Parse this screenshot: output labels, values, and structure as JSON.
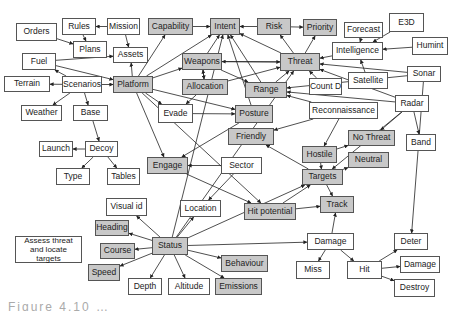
{
  "diagram": {
    "type": "concept-map",
    "colors": {
      "grey_node": "#c8c8c8",
      "white_node": "#ffffff",
      "border": "#555555",
      "edge": "#222222"
    },
    "nodes": [
      {
        "id": "orders",
        "label": "Orders",
        "x": 16,
        "y": 23,
        "w": 41,
        "h": 18,
        "style": "white"
      },
      {
        "id": "rules",
        "label": "Rules",
        "x": 62,
        "y": 18,
        "w": 34,
        "h": 17,
        "style": "white"
      },
      {
        "id": "mission",
        "label": "Mission",
        "x": 107,
        "y": 18,
        "w": 33,
        "h": 17,
        "style": "white"
      },
      {
        "id": "plans",
        "label": "Plans",
        "x": 73,
        "y": 41,
        "w": 34,
        "h": 17,
        "style": "white"
      },
      {
        "id": "assets",
        "label": "Assets",
        "x": 113,
        "y": 47,
        "w": 35,
        "h": 16,
        "style": "white"
      },
      {
        "id": "fuel",
        "label": "Fuel",
        "x": 22,
        "y": 53,
        "w": 34,
        "h": 17,
        "style": "white"
      },
      {
        "id": "terrain",
        "label": "Terrain",
        "x": 4,
        "y": 76,
        "w": 46,
        "h": 16,
        "style": "white"
      },
      {
        "id": "scenarios",
        "label": "Scenarios",
        "x": 62,
        "y": 76,
        "w": 40,
        "h": 17,
        "style": "white"
      },
      {
        "id": "platform",
        "label": "Platform",
        "x": 113,
        "y": 76,
        "w": 40,
        "h": 17,
        "style": "grey"
      },
      {
        "id": "capability",
        "label": "Capability",
        "x": 148,
        "y": 18,
        "w": 45,
        "h": 17,
        "style": "grey"
      },
      {
        "id": "intent",
        "label": "Intent",
        "x": 210,
        "y": 18,
        "w": 30,
        "h": 17,
        "style": "grey"
      },
      {
        "id": "risk",
        "label": "Risk",
        "x": 257,
        "y": 18,
        "w": 34,
        "h": 17,
        "style": "grey"
      },
      {
        "id": "priority",
        "label": "Priority",
        "x": 303,
        "y": 19,
        "w": 34,
        "h": 17,
        "style": "grey"
      },
      {
        "id": "forecast",
        "label": "Forecast",
        "x": 344,
        "y": 22,
        "w": 39,
        "h": 16,
        "style": "white"
      },
      {
        "id": "e3d",
        "label": "E3D",
        "x": 389,
        "y": 13,
        "w": 35,
        "h": 19,
        "style": "white"
      },
      {
        "id": "intelligence",
        "label": "Intelligence",
        "x": 332,
        "y": 42,
        "w": 51,
        "h": 18,
        "style": "white"
      },
      {
        "id": "humint",
        "label": "Humint",
        "x": 412,
        "y": 37,
        "w": 36,
        "h": 18,
        "style": "white"
      },
      {
        "id": "weapons",
        "label": "Weapons",
        "x": 182,
        "y": 53,
        "w": 40,
        "h": 17,
        "style": "grey"
      },
      {
        "id": "threat",
        "label": "Threat",
        "x": 280,
        "y": 53,
        "w": 40,
        "h": 18,
        "style": "grey"
      },
      {
        "id": "satellite",
        "label": "Satellite",
        "x": 348,
        "y": 72,
        "w": 40,
        "h": 17,
        "style": "white"
      },
      {
        "id": "sonar",
        "label": "Sonar",
        "x": 407,
        "y": 66,
        "w": 34,
        "h": 16,
        "style": "white"
      },
      {
        "id": "allocation",
        "label": "Allocation",
        "x": 182,
        "y": 79,
        "w": 46,
        "h": 16,
        "style": "grey"
      },
      {
        "id": "range",
        "label": "Range",
        "x": 245,
        "y": 82,
        "w": 42,
        "h": 16,
        "style": "grey"
      },
      {
        "id": "countd",
        "label": "Count D",
        "x": 309,
        "y": 78,
        "w": 33,
        "h": 17,
        "style": "white"
      },
      {
        "id": "radar",
        "label": "Radar",
        "x": 395,
        "y": 95,
        "w": 34,
        "h": 17,
        "style": "white"
      },
      {
        "id": "weather",
        "label": "Weather",
        "x": 21,
        "y": 105,
        "w": 41,
        "h": 16,
        "style": "white"
      },
      {
        "id": "base",
        "label": "Base",
        "x": 73,
        "y": 105,
        "w": 35,
        "h": 16,
        "style": "white"
      },
      {
        "id": "evade",
        "label": "Evade",
        "x": 158,
        "y": 104,
        "w": 35,
        "h": 19,
        "style": "white"
      },
      {
        "id": "posture",
        "label": "Posture",
        "x": 235,
        "y": 105,
        "w": 38,
        "h": 18,
        "style": "grey"
      },
      {
        "id": "reconnaissance",
        "label": "Reconnaissance",
        "x": 309,
        "y": 102,
        "w": 69,
        "h": 17,
        "style": "white"
      },
      {
        "id": "friendly",
        "label": "Friendly",
        "x": 228,
        "y": 128,
        "w": 46,
        "h": 17,
        "style": "grey"
      },
      {
        "id": "nothreat",
        "label": "No Threat",
        "x": 348,
        "y": 130,
        "w": 47,
        "h": 16,
        "style": "grey"
      },
      {
        "id": "band",
        "label": "Band",
        "x": 406,
        "y": 134,
        "w": 30,
        "h": 17,
        "style": "white"
      },
      {
        "id": "launch",
        "label": "Launch",
        "x": 39,
        "y": 141,
        "w": 34,
        "h": 16,
        "style": "white"
      },
      {
        "id": "decoy",
        "label": "Decoy",
        "x": 85,
        "y": 141,
        "w": 33,
        "h": 16,
        "style": "white"
      },
      {
        "id": "hostile",
        "label": "Hostile",
        "x": 302,
        "y": 146,
        "w": 35,
        "h": 17,
        "style": "grey"
      },
      {
        "id": "neutral",
        "label": "Neutral",
        "x": 348,
        "y": 152,
        "w": 41,
        "h": 16,
        "style": "grey"
      },
      {
        "id": "engage",
        "label": "Engage",
        "x": 147,
        "y": 157,
        "w": 41,
        "h": 17,
        "style": "grey"
      },
      {
        "id": "sector",
        "label": "Sector",
        "x": 221,
        "y": 157,
        "w": 41,
        "h": 17,
        "style": "white"
      },
      {
        "id": "type",
        "label": "Type",
        "x": 56,
        "y": 168,
        "w": 34,
        "h": 17,
        "style": "white"
      },
      {
        "id": "tables",
        "label": "Tables",
        "x": 107,
        "y": 168,
        "w": 33,
        "h": 17,
        "style": "white"
      },
      {
        "id": "targets",
        "label": "Targets",
        "x": 302,
        "y": 169,
        "w": 41,
        "h": 16,
        "style": "grey"
      },
      {
        "id": "track",
        "label": "Track",
        "x": 320,
        "y": 196,
        "w": 34,
        "h": 17,
        "style": "grey"
      },
      {
        "id": "visualid",
        "label": "Visual id",
        "x": 106,
        "y": 198,
        "w": 41,
        "h": 18,
        "style": "white"
      },
      {
        "id": "location",
        "label": "Location",
        "x": 180,
        "y": 200,
        "w": 41,
        "h": 17,
        "style": "white"
      },
      {
        "id": "hitpotential",
        "label": "Hit potential",
        "x": 244,
        "y": 203,
        "w": 52,
        "h": 17,
        "style": "grey"
      },
      {
        "id": "heading",
        "label": "Heading",
        "x": 95,
        "y": 220,
        "w": 34,
        "h": 16,
        "style": "grey"
      },
      {
        "id": "damage_mid",
        "label": "Damage",
        "x": 307,
        "y": 233,
        "w": 47,
        "h": 17,
        "style": "white"
      },
      {
        "id": "deter",
        "label": "Deter",
        "x": 394,
        "y": 233,
        "w": 34,
        "h": 17,
        "style": "white"
      },
      {
        "id": "assess",
        "label": "Assess threat and locate targets",
        "x": 15,
        "y": 236,
        "w": 67,
        "h": 27,
        "style": "note"
      },
      {
        "id": "status",
        "label": "Status",
        "x": 152,
        "y": 237,
        "w": 36,
        "h": 18,
        "style": "grey"
      },
      {
        "id": "course",
        "label": "Course",
        "x": 100,
        "y": 243,
        "w": 35,
        "h": 16,
        "style": "grey"
      },
      {
        "id": "behaviour",
        "label": "Behaviour",
        "x": 221,
        "y": 255,
        "w": 47,
        "h": 17,
        "style": "grey"
      },
      {
        "id": "damage_right",
        "label": "Damage",
        "x": 400,
        "y": 256,
        "w": 40,
        "h": 17,
        "style": "white"
      },
      {
        "id": "miss",
        "label": "Miss",
        "x": 296,
        "y": 261,
        "w": 34,
        "h": 18,
        "style": "white"
      },
      {
        "id": "hit",
        "label": "Hit",
        "x": 347,
        "y": 261,
        "w": 35,
        "h": 18,
        "style": "white"
      },
      {
        "id": "speed",
        "label": "Speed",
        "x": 88,
        "y": 264,
        "w": 32,
        "h": 17,
        "style": "grey"
      },
      {
        "id": "depth",
        "label": "Depth",
        "x": 128,
        "y": 278,
        "w": 34,
        "h": 17,
        "style": "white"
      },
      {
        "id": "altitude",
        "label": "Altitude",
        "x": 168,
        "y": 278,
        "w": 42,
        "h": 17,
        "style": "white"
      },
      {
        "id": "emissions",
        "label": "Emissions",
        "x": 215,
        "y": 278,
        "w": 47,
        "h": 17,
        "style": "grey"
      },
      {
        "id": "destroy",
        "label": "Destroy",
        "x": 394,
        "y": 279,
        "w": 41,
        "h": 18,
        "style": "white"
      }
    ],
    "edges": [
      [
        "mission",
        "rules"
      ],
      [
        "orders",
        "plans"
      ],
      [
        "rules",
        "plans"
      ],
      [
        "mission",
        "assets"
      ],
      [
        "fuel",
        "assets"
      ],
      [
        "fuel",
        "platform"
      ],
      [
        "scenarios",
        "fuel"
      ],
      [
        "scenarios",
        "terrain"
      ],
      [
        "scenarios",
        "platform"
      ],
      [
        "scenarios",
        "weather"
      ],
      [
        "scenarios",
        "base"
      ],
      [
        "platform",
        "assets"
      ],
      [
        "platform",
        "weapons"
      ],
      [
        "platform",
        "capability"
      ],
      [
        "platform",
        "intent"
      ],
      [
        "platform",
        "evade"
      ],
      [
        "platform",
        "engage"
      ],
      [
        "platform",
        "posture"
      ],
      [
        "platform",
        "hitpotential"
      ],
      [
        "base",
        "decoy"
      ],
      [
        "decoy",
        "launch"
      ],
      [
        "decoy",
        "type"
      ],
      [
        "decoy",
        "tables"
      ],
      [
        "capability",
        "intent"
      ],
      [
        "risk",
        "intent"
      ],
      [
        "risk",
        "priority"
      ],
      [
        "threat",
        "priority"
      ],
      [
        "threat",
        "risk"
      ],
      [
        "threat",
        "intent"
      ],
      [
        "weapons",
        "intent"
      ],
      [
        "weapons",
        "threat"
      ],
      [
        "threat",
        "weapons"
      ],
      [
        "weapons",
        "allocation"
      ],
      [
        "allocation",
        "weapons"
      ],
      [
        "weapons",
        "range"
      ],
      [
        "allocation",
        "threat"
      ],
      [
        "range",
        "intent"
      ],
      [
        "range",
        "threat"
      ],
      [
        "countd",
        "threat"
      ],
      [
        "forecast",
        "intelligence"
      ],
      [
        "intelligence",
        "threat"
      ],
      [
        "e3d",
        "intelligence"
      ],
      [
        "humint",
        "intelligence"
      ],
      [
        "satellite",
        "intelligence"
      ],
      [
        "sonar",
        "threat"
      ],
      [
        "sonar",
        "range"
      ],
      [
        "radar",
        "range"
      ],
      [
        "radar",
        "band"
      ],
      [
        "radar",
        "targets"
      ],
      [
        "radar",
        "nothreat"
      ],
      [
        "radar",
        "threat"
      ],
      [
        "reconnaissance",
        "range"
      ],
      [
        "reconnaissance",
        "hostile"
      ],
      [
        "reconnaissance",
        "friendly"
      ],
      [
        "evade",
        "posture"
      ],
      [
        "allocation",
        "evade"
      ],
      [
        "posture",
        "engage"
      ],
      [
        "posture",
        "intent"
      ],
      [
        "sector",
        "engage"
      ],
      [
        "sector",
        "location"
      ],
      [
        "engage",
        "hitpotential"
      ],
      [
        "hostile",
        "nothreat"
      ],
      [
        "hostile",
        "targets"
      ],
      [
        "targets",
        "neutral"
      ],
      [
        "targets",
        "track"
      ],
      [
        "targets",
        "friendly"
      ],
      [
        "hitpotential",
        "track"
      ],
      [
        "hitpotential",
        "targets"
      ],
      [
        "status",
        "visualid"
      ],
      [
        "status",
        "heading"
      ],
      [
        "status",
        "course"
      ],
      [
        "status",
        "speed"
      ],
      [
        "status",
        "depth"
      ],
      [
        "status",
        "altitude"
      ],
      [
        "status",
        "emissions"
      ],
      [
        "status",
        "behaviour"
      ],
      [
        "status",
        "location"
      ],
      [
        "status",
        "damage_mid"
      ],
      [
        "status",
        "intent"
      ],
      [
        "status",
        "threat"
      ],
      [
        "status",
        "targets"
      ],
      [
        "damage_mid",
        "track"
      ],
      [
        "damage_mid",
        "miss"
      ],
      [
        "damage_mid",
        "hit"
      ],
      [
        "hit",
        "deter"
      ],
      [
        "hit",
        "damage_right"
      ],
      [
        "hit",
        "destroy"
      ],
      [
        "sonar",
        "deter"
      ]
    ]
  },
  "caption": {
    "text": "Figure 4.10 …"
  }
}
